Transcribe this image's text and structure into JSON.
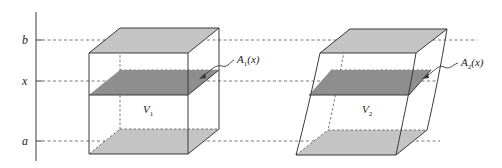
{
  "figure": {
    "type": "cavalieri-principle-solids",
    "axis_labels": {
      "b": "b",
      "x": "x",
      "a": "a"
    },
    "solid_1": {
      "volume_label": "V",
      "volume_sub": "1",
      "area_label": "A",
      "area_sub": "1",
      "area_arg": "(x)"
    },
    "solid_2": {
      "volume_label": "V",
      "volume_sub": "2",
      "area_label": "A",
      "area_sub": "2",
      "area_arg": "(x)"
    }
  },
  "colors": {
    "line": "#3a3a3a",
    "face_light": "#c4c4c4",
    "section_dark": "#8e8e8e",
    "dash": "#555555"
  }
}
